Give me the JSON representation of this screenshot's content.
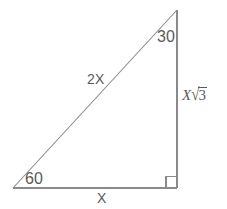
{
  "figure": {
    "kind": "geometry-diagram",
    "background_color": "#ffffff",
    "line_color": "#8a8a8a",
    "text_color": "#5a5a5a",
    "canvas": {
      "width": 227,
      "height": 209
    },
    "vertices": {
      "left": {
        "x": 13,
        "y": 188
      },
      "apex": {
        "x": 177,
        "y": 10
      },
      "right": {
        "x": 177,
        "y": 188
      }
    },
    "right_angle_marker": {
      "x": 166,
      "y": 176,
      "size": 11
    },
    "labels": {
      "angle_top": "30",
      "angle_bottom_left": "60",
      "hypotenuse": "2X",
      "base": "X",
      "height_variable": "X",
      "height_radical_sign": "√",
      "height_radicand": "3"
    }
  }
}
